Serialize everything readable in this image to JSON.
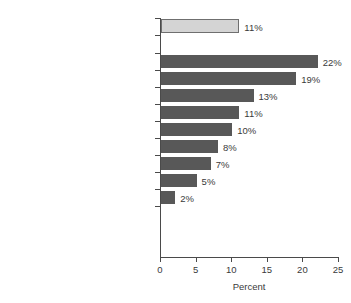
{
  "chart_data": {
    "type": "bar",
    "orientation": "horizontal",
    "title": "",
    "xlabel": "Percent",
    "ylabel": "",
    "xlim": [
      0,
      25
    ],
    "xticks": [
      0,
      5,
      10,
      15,
      20,
      25
    ],
    "grid": false,
    "legend": null,
    "categories": [
      "All occupations",
      "Professional",
      "Associate professional and technical",
      "Managers and administrators",
      "Clerical, secretarial",
      "Personal, protective",
      "Craft and related",
      "Sales",
      "Plant and machine",
      "Other"
    ],
    "values": [
      11,
      22,
      19,
      13,
      11,
      10,
      8,
      7,
      5,
      2
    ],
    "value_labels": [
      "11%",
      "22%",
      "19%",
      "13%",
      "11%",
      "10%",
      "8%",
      "7%",
      "5%",
      "2%"
    ],
    "bar_styles": [
      "highlight",
      "normal",
      "normal",
      "normal",
      "normal",
      "normal",
      "normal",
      "normal",
      "normal",
      "normal"
    ],
    "colors": {
      "bar": "#585858",
      "bar_highlight_fill": "#d4d4d4",
      "bar_highlight_border": "#6f6f6f",
      "axis": "#4a4a4a",
      "text": "#3a3a3a",
      "background": "#ffffff"
    }
  }
}
